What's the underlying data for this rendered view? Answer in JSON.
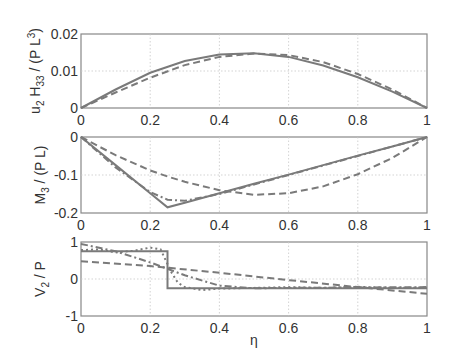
{
  "chart_data": [
    {
      "type": "line",
      "title": "",
      "xlabel": "",
      "ylabel": "u2 H33 / (P L^3)",
      "ylabel_parts": {
        "a": "u",
        "a_sub": "2",
        "b": " H",
        "b_sub": "33",
        "c": " / (P L",
        "c_sup": "3",
        "d": ")"
      },
      "xlim": [
        0,
        1
      ],
      "ylim": [
        0,
        0.02
      ],
      "xticks": [
        "0",
        "0.2",
        "0.4",
        "0.6",
        "0.8",
        "1"
      ],
      "yticks": [
        "0.02",
        "0.01",
        "0"
      ],
      "grid": true,
      "x": [
        0,
        0.1,
        0.2,
        0.3,
        0.4,
        0.5,
        0.6,
        0.7,
        0.8,
        0.9,
        1
      ],
      "series": [
        {
          "name": "solid",
          "style": "solid",
          "values": [
            0,
            0.005,
            0.0095,
            0.0127,
            0.0145,
            0.0148,
            0.0138,
            0.0115,
            0.0083,
            0.0044,
            0
          ]
        },
        {
          "name": "dashed",
          "style": "dashed",
          "values": [
            0,
            0.0042,
            0.0082,
            0.0116,
            0.0138,
            0.0147,
            0.0143,
            0.0124,
            0.0092,
            0.005,
            0
          ]
        }
      ]
    },
    {
      "type": "line",
      "title": "",
      "xlabel": "",
      "ylabel": "M3 / (P L)",
      "ylabel_parts": {
        "a": "M",
        "a_sub": "3",
        "b": " / (P L)"
      },
      "xlim": [
        0,
        1
      ],
      "ylim": [
        -0.2,
        0
      ],
      "xticks": [
        "0",
        "0.2",
        "0.4",
        "0.6",
        "0.8",
        "1"
      ],
      "yticks": [
        "0",
        "-0.1",
        "-0.2"
      ],
      "grid": true,
      "x": [
        0,
        0.1,
        0.2,
        0.25,
        0.3,
        0.4,
        0.5,
        0.6,
        0.7,
        0.8,
        0.9,
        1
      ],
      "series": [
        {
          "name": "solid",
          "style": "solid",
          "values": [
            0,
            -0.074,
            -0.148,
            -0.185,
            -0.173,
            -0.148,
            -0.123,
            -0.099,
            -0.074,
            -0.049,
            -0.025,
            0
          ]
        },
        {
          "name": "dash-dot",
          "style": "dashdot",
          "values": [
            0,
            -0.08,
            -0.145,
            -0.165,
            -0.168,
            -0.15,
            -0.125,
            -0.1,
            -0.075,
            -0.05,
            -0.025,
            0
          ]
        },
        {
          "name": "dashed",
          "style": "dashed",
          "values": [
            0,
            -0.048,
            -0.088,
            -0.104,
            -0.118,
            -0.14,
            -0.152,
            -0.148,
            -0.13,
            -0.098,
            -0.055,
            0
          ]
        }
      ]
    },
    {
      "type": "line",
      "title": "",
      "xlabel": "η",
      "ylabel": "V2 / P",
      "ylabel_parts": {
        "a": "V",
        "a_sub": "2",
        "b": " / P"
      },
      "xlim": [
        0,
        1
      ],
      "ylim": [
        -1,
        1
      ],
      "xticks": [
        "0",
        "0.2",
        "0.4",
        "0.6",
        "0.8",
        "1"
      ],
      "yticks": [
        "1",
        "0",
        "-1"
      ],
      "grid": true,
      "series": [
        {
          "name": "solid",
          "style": "solid",
          "x": [
            0,
            0.25,
            0.25,
            1
          ],
          "values": [
            0.75,
            0.75,
            -0.25,
            -0.25
          ]
        },
        {
          "name": "dashed",
          "style": "dashed",
          "x": [
            0,
            0.2,
            0.4,
            0.6,
            0.8,
            1
          ],
          "values": [
            0.48,
            0.35,
            0.17,
            -0.03,
            -0.22,
            -0.4
          ]
        },
        {
          "name": "dash-dot",
          "style": "dashdot",
          "x": [
            0,
            0.1,
            0.2,
            0.3,
            0.4,
            0.5,
            0.6,
            0.8,
            1
          ],
          "values": [
            0.95,
            0.75,
            0.45,
            0.1,
            -0.18,
            -0.25,
            -0.24,
            -0.23,
            -0.22
          ]
        },
        {
          "name": "dotted",
          "style": "dotted",
          "x": [
            0,
            0.05,
            0.1,
            0.15,
            0.2,
            0.23,
            0.26,
            0.28,
            0.3,
            0.35,
            0.4,
            0.5,
            0.6,
            0.7,
            0.8,
            0.9,
            1
          ],
          "values": [
            0.78,
            0.8,
            0.72,
            0.76,
            0.85,
            0.8,
            0.2,
            -0.1,
            -0.22,
            -0.3,
            -0.26,
            -0.24,
            -0.22,
            -0.24,
            -0.21,
            -0.24,
            -0.23
          ]
        }
      ]
    }
  ],
  "colors": {
    "line": "#7a7a7a",
    "frame": "#888888",
    "grid": "#c8c8c8",
    "text": "#333333"
  }
}
